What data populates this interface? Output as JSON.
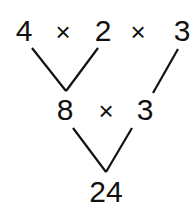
{
  "diagram": {
    "type": "factor-tree",
    "row1": {
      "factors": [
        "4",
        "2",
        "3"
      ],
      "operator": "×"
    },
    "row2": {
      "factors": [
        "8",
        "3"
      ],
      "operator": "×"
    },
    "result": "24",
    "line_color": "#111111",
    "text_color": "#111111",
    "background": "#ffffff"
  }
}
